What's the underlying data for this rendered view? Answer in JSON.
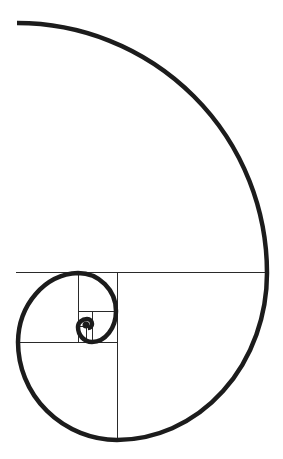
{
  "diagram": {
    "background": "#ffffff",
    "line_color": "#2a2a2a",
    "spiral_color": "#1c1c1c",
    "spiral_width": 4.5,
    "grid_lines": [
      {
        "x1": 16,
        "y1": 272.5,
        "x2": 267,
        "y2": 272.5
      },
      {
        "x1": 117.5,
        "y1": 272.5,
        "x2": 117.5,
        "y2": 440
      },
      {
        "x1": 20,
        "y1": 342.5,
        "x2": 117.5,
        "y2": 342.5
      },
      {
        "x1": 78.5,
        "y1": 272.5,
        "x2": 78.5,
        "y2": 342.5
      },
      {
        "x1": 78.5,
        "y1": 311.5,
        "x2": 116,
        "y2": 311.5
      },
      {
        "x1": 92.5,
        "y1": 311.5,
        "x2": 92.5,
        "y2": 342.5
      },
      {
        "x1": 78.5,
        "y1": 326.5,
        "x2": 92.5,
        "y2": 326.5
      },
      {
        "x1": 86.5,
        "y1": 326.5,
        "x2": 86.5,
        "y2": 342.5
      }
    ],
    "spiral_path": "M17,23 A250,250 0 0 1 267,273 A150,167 0 0 1 117,440 A100,98 0 0 1 18,342 A62,70 0 0 1 78,273 A38,38 0 0 1 116,311 A24,31 0 0 1 92,342 A14,15 0 0 1 78,327 A9,8 0 0 1 87,319 A5,5 0 0 1 92,324 A4,4 0 0 1 88,328"
  }
}
